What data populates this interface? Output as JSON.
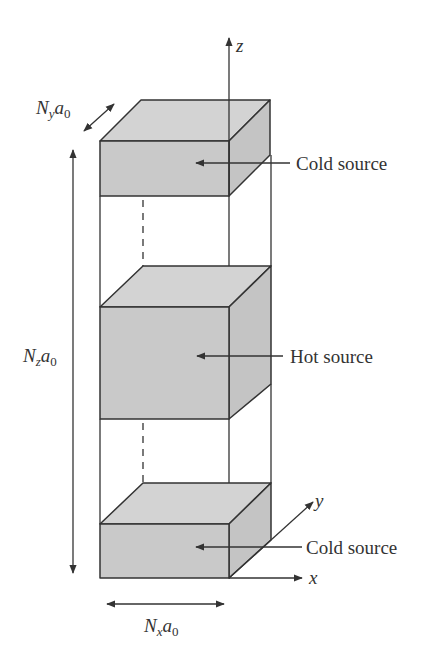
{
  "diagram": {
    "colors": {
      "face": "#c9c9c9",
      "top": "#d3d3d3",
      "side": "#c4c4c4",
      "stroke": "#333333",
      "background": "#ffffff"
    },
    "axes": {
      "z": "z",
      "y": "y",
      "x": "x"
    },
    "dimensions": {
      "ny": {
        "main": "N",
        "sub1": "y",
        "mid": "a",
        "sub2": "0"
      },
      "nz": {
        "main": "N",
        "sub1": "z",
        "mid": "a",
        "sub2": "0"
      },
      "nx": {
        "main": "N",
        "sub1": "x",
        "mid": "a",
        "sub2": "0"
      }
    },
    "boxes": [
      {
        "id": "top",
        "label": "Cold source"
      },
      {
        "id": "middle",
        "label": "Hot source"
      },
      {
        "id": "bottom",
        "label": "Cold source"
      }
    ]
  }
}
